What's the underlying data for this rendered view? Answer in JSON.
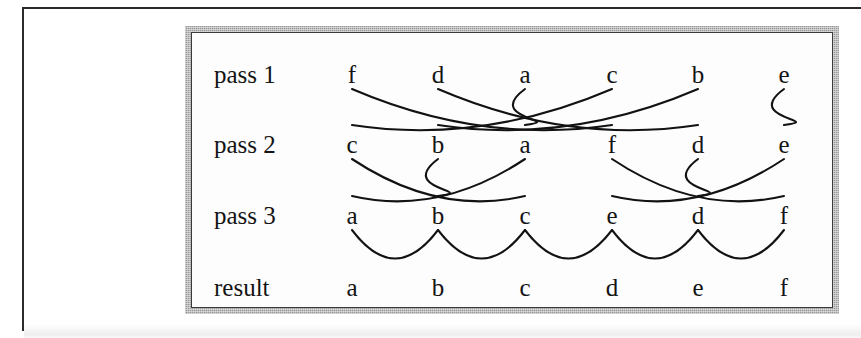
{
  "figure": {
    "kind": "bubble-sort pass diagram",
    "colors": {
      "ink": "#121212",
      "frame_gray": "#9a9a9a",
      "frame_inner_line": "#3a3a3a",
      "paper": "#fdfdfd",
      "page_rule": "#2b2b2b"
    },
    "column_count": 6,
    "rows": [
      {
        "id": "pass1",
        "label": "pass 1",
        "items": [
          "f",
          "d",
          "a",
          "c",
          "b",
          "e"
        ]
      },
      {
        "id": "pass2",
        "label": "pass 2",
        "items": [
          "c",
          "b",
          "a",
          "f",
          "d",
          "e"
        ]
      },
      {
        "id": "pass3",
        "label": "pass 3",
        "items": [
          "a",
          "b",
          "c",
          "e",
          "d",
          "f"
        ]
      },
      {
        "id": "result",
        "label": "result",
        "items": [
          "a",
          "b",
          "c",
          "d",
          "e",
          "f"
        ]
      }
    ],
    "bands": [
      {
        "id": "band-pass1-pass2",
        "from": "pass1",
        "to": "pass2",
        "style": "crossing-arcs",
        "mapping": [
          {
            "letter": "f",
            "from_col": 1,
            "to_col": 4
          },
          {
            "letter": "d",
            "from_col": 2,
            "to_col": 5
          },
          {
            "letter": "a",
            "from_col": 3,
            "to_col": 3
          },
          {
            "letter": "c",
            "from_col": 4,
            "to_col": 1
          },
          {
            "letter": "b",
            "from_col": 5,
            "to_col": 2
          },
          {
            "letter": "e",
            "from_col": 6,
            "to_col": 6
          }
        ]
      },
      {
        "id": "band-pass2-pass3",
        "from": "pass2",
        "to": "pass3",
        "style": "crossing-arcs",
        "mapping": [
          {
            "letter": "c",
            "from_col": 1,
            "to_col": 3
          },
          {
            "letter": "b",
            "from_col": 2,
            "to_col": 2
          },
          {
            "letter": "a",
            "from_col": 3,
            "to_col": 1
          },
          {
            "letter": "f",
            "from_col": 4,
            "to_col": 6
          },
          {
            "letter": "d",
            "from_col": 5,
            "to_col": 5
          },
          {
            "letter": "e",
            "from_col": 6,
            "to_col": 4
          }
        ]
      },
      {
        "id": "band-pass3-result",
        "from": "pass3",
        "to": "result",
        "style": "scallop-arcs",
        "arc_count": 5
      }
    ]
  }
}
